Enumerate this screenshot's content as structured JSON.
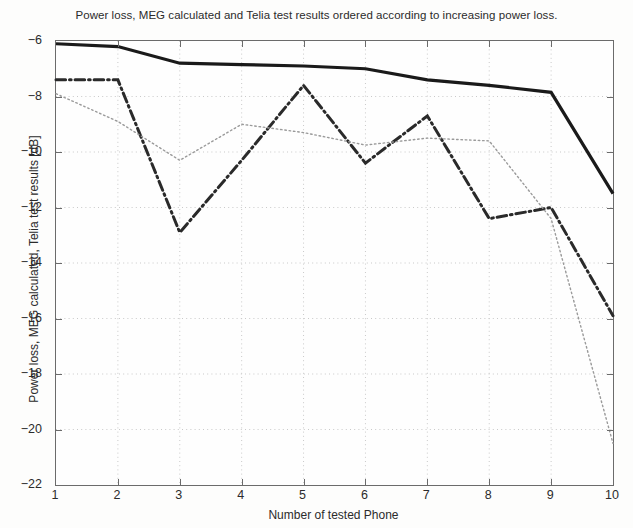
{
  "chart_data": {
    "type": "line",
    "title": "Power loss, MEG calculated and Telia test results ordered according to increasing power loss.",
    "xlabel": "Number of tested Phone",
    "ylabel": "Power loss, MEG calculated, Telia test results [dB]",
    "x": [
      1,
      2,
      3,
      4,
      5,
      6,
      7,
      8,
      9,
      10
    ],
    "xlim": [
      1,
      10
    ],
    "ylim": [
      -22,
      -6
    ],
    "xticks": [
      1,
      2,
      3,
      4,
      5,
      6,
      7,
      8,
      9,
      10
    ],
    "yticks": [
      -6,
      -8,
      -10,
      -12,
      -14,
      -16,
      -18,
      -20,
      -22
    ],
    "xticklabels": [
      "1",
      "2",
      "3",
      "4",
      "5",
      "6",
      "7",
      "8",
      "9",
      "10"
    ],
    "yticklabels": [
      "-6",
      "-8",
      "-10",
      "-12",
      "-14",
      "-16",
      "-18",
      "-20",
      "-22"
    ],
    "grid": true,
    "grid_style": "dotted",
    "legend": "none",
    "series": [
      {
        "name": "Power loss",
        "style": "solid",
        "width": 3.2,
        "color": "#1a1a1a",
        "values": [
          -6.1,
          -6.2,
          -6.8,
          -6.85,
          -6.9,
          -7.0,
          -7.4,
          -7.6,
          -7.85,
          -11.5
        ]
      },
      {
        "name": "MEG calculated",
        "style": "dash-dot",
        "width": 3.0,
        "color": "#2a2a2a",
        "values": [
          -7.4,
          -7.4,
          -12.9,
          -10.3,
          -7.6,
          -10.4,
          -8.7,
          -12.4,
          -12.0,
          -15.9
        ]
      },
      {
        "name": "Telia test results",
        "style": "dotted",
        "width": 1.4,
        "color": "#9a9a9a",
        "values": [
          -7.9,
          -8.9,
          -10.3,
          -9.0,
          -9.3,
          -9.75,
          -9.5,
          -9.6,
          -12.4,
          -20.5
        ]
      }
    ]
  },
  "axes": {
    "plot_left_px": 55,
    "plot_top_px": 40,
    "plot_width_px": 557,
    "plot_height_px": 444
  }
}
